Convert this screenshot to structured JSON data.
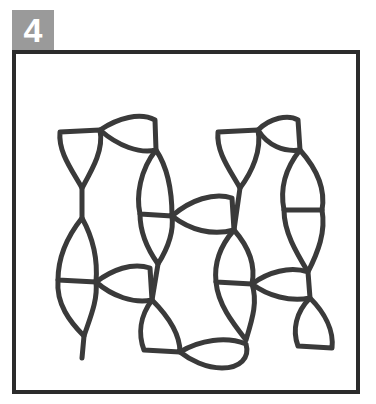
{
  "badge": {
    "label": "4",
    "background": "#9a9a9a",
    "text_color": "#ffffff"
  },
  "figure": {
    "frame_color": "#2b2b2b",
    "stroke_color": "#3a3a3a"
  }
}
